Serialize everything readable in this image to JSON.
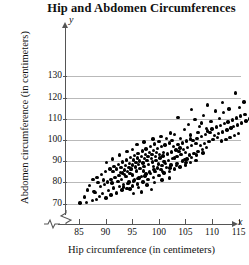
{
  "chart_data": {
    "type": "scatter",
    "title": "Hip and Abdomen Circumferences",
    "xlabel": "Hip circumference (in centimeters)",
    "ylabel": "Abdomen circumference (in centimeters)",
    "x_axis_symbol": "x",
    "y_axis_symbol": "y",
    "xlim": [
      82,
      118
    ],
    "ylim": [
      66,
      134
    ],
    "xticks": [
      85,
      90,
      95,
      100,
      105,
      110,
      115
    ],
    "yticks": [
      70,
      80,
      90,
      100,
      110,
      120,
      130
    ],
    "grid": "horizontal",
    "axis_break_x": true,
    "axis_break_y": true,
    "legend": "none",
    "marker_color": "#000000",
    "gridline_color": "#b9b9b9",
    "axis_color": "#555555",
    "points": [
      [
        85.2,
        70.2
      ],
      [
        86.4,
        70.4
      ],
      [
        87.5,
        71.3
      ],
      [
        88.3,
        72.0
      ],
      [
        86.0,
        73.1
      ],
      [
        88.9,
        73.4
      ],
      [
        90.1,
        72.6
      ],
      [
        89.4,
        74.8
      ],
      [
        87.8,
        75.6
      ],
      [
        91.0,
        74.1
      ],
      [
        90.6,
        76.2
      ],
      [
        92.0,
        75.0
      ],
      [
        91.5,
        77.3
      ],
      [
        89.0,
        77.9
      ],
      [
        93.1,
        76.4
      ],
      [
        92.6,
        78.1
      ],
      [
        94.0,
        77.2
      ],
      [
        93.4,
        79.0
      ],
      [
        91.2,
        79.6
      ],
      [
        95.0,
        78.3
      ],
      [
        94.4,
        80.1
      ],
      [
        96.0,
        79.2
      ],
      [
        95.4,
        81.0
      ],
      [
        93.0,
        81.4
      ],
      [
        97.0,
        80.2
      ],
      [
        96.3,
        82.1
      ],
      [
        98.0,
        81.3
      ],
      [
        97.4,
        83.0
      ],
      [
        95.1,
        83.5
      ],
      [
        99.0,
        82.2
      ],
      [
        98.4,
        84.1
      ],
      [
        100.0,
        83.2
      ],
      [
        99.3,
        85.0
      ],
      [
        97.1,
        85.4
      ],
      [
        101.0,
        84.3
      ],
      [
        100.4,
        86.1
      ],
      [
        102.0,
        85.2
      ],
      [
        101.4,
        87.0
      ],
      [
        99.0,
        87.4
      ],
      [
        103.0,
        86.3
      ],
      [
        102.3,
        88.1
      ],
      [
        104.0,
        87.2
      ],
      [
        103.4,
        89.0
      ],
      [
        101.1,
        89.5
      ],
      [
        105.0,
        88.2
      ],
      [
        104.4,
        90.1
      ],
      [
        106.0,
        89.3
      ],
      [
        105.3,
        91.0
      ],
      [
        103.0,
        91.5
      ],
      [
        107.0,
        90.2
      ],
      [
        92.3,
        80.5
      ],
      [
        93.8,
        82.6
      ],
      [
        94.6,
        84.2
      ],
      [
        95.8,
        85.3
      ],
      [
        96.5,
        86.4
      ],
      [
        97.2,
        87.6
      ],
      [
        98.1,
        88.4
      ],
      [
        98.8,
        89.5
      ],
      [
        99.5,
        90.3
      ],
      [
        100.2,
        91.4
      ],
      [
        94.2,
        79.4
      ],
      [
        95.2,
        80.6
      ],
      [
        96.1,
        81.7
      ],
      [
        96.8,
        82.8
      ],
      [
        97.6,
        83.9
      ],
      [
        98.3,
        84.8
      ],
      [
        99.1,
        85.9
      ],
      [
        99.8,
        86.8
      ],
      [
        100.6,
        87.9
      ],
      [
        101.3,
        88.8
      ],
      [
        93.5,
        83.8
      ],
      [
        94.8,
        86.0
      ],
      [
        95.6,
        87.2
      ],
      [
        96.2,
        88.3
      ],
      [
        97.0,
        89.1
      ],
      [
        97.8,
        90.2
      ],
      [
        98.6,
        91.1
      ],
      [
        99.4,
        92.2
      ],
      [
        100.1,
        93.1
      ],
      [
        100.9,
        94.0
      ],
      [
        92.8,
        84.6
      ],
      [
        93.6,
        85.8
      ],
      [
        94.4,
        87.0
      ],
      [
        95.0,
        88.1
      ],
      [
        95.7,
        89.2
      ],
      [
        96.4,
        90.0
      ],
      [
        97.3,
        91.2
      ],
      [
        98.0,
        92.1
      ],
      [
        98.7,
        93.0
      ],
      [
        99.6,
        94.2
      ],
      [
        91.8,
        82.4
      ],
      [
        92.5,
        83.2
      ],
      [
        93.2,
        84.4
      ],
      [
        94.1,
        85.2
      ],
      [
        94.9,
        86.6
      ],
      [
        91.4,
        85.0
      ],
      [
        92.1,
        86.2
      ],
      [
        92.9,
        87.1
      ],
      [
        93.7,
        88.0
      ],
      [
        94.5,
        88.9
      ],
      [
        95.3,
        90.5
      ],
      [
        96.0,
        91.4
      ],
      [
        96.7,
        92.3
      ],
      [
        97.5,
        93.2
      ],
      [
        98.2,
        94.1
      ],
      [
        99.0,
        95.0
      ],
      [
        99.7,
        95.9
      ],
      [
        100.5,
        96.8
      ],
      [
        101.2,
        97.6
      ],
      [
        102.0,
        98.5
      ],
      [
        100.8,
        92.5
      ],
      [
        101.6,
        93.4
      ],
      [
        102.4,
        94.3
      ],
      [
        103.2,
        95.2
      ],
      [
        104.0,
        96.1
      ],
      [
        101.8,
        90.4
      ],
      [
        102.6,
        91.3
      ],
      [
        103.4,
        92.2
      ],
      [
        104.2,
        93.1
      ],
      [
        105.0,
        94.0
      ],
      [
        102.8,
        96.8
      ],
      [
        103.6,
        97.7
      ],
      [
        104.4,
        98.6
      ],
      [
        105.2,
        99.5
      ],
      [
        106.0,
        100.4
      ],
      [
        103.8,
        94.6
      ],
      [
        104.6,
        95.5
      ],
      [
        105.4,
        96.4
      ],
      [
        106.2,
        97.3
      ],
      [
        107.0,
        98.2
      ],
      [
        105.8,
        92.8
      ],
      [
        106.6,
        93.7
      ],
      [
        107.4,
        94.6
      ],
      [
        108.2,
        95.5
      ],
      [
        109.0,
        96.4
      ],
      [
        106.4,
        99.8
      ],
      [
        107.2,
        100.7
      ],
      [
        108.0,
        101.6
      ],
      [
        108.8,
        102.5
      ],
      [
        109.6,
        103.4
      ],
      [
        107.8,
        97.5
      ],
      [
        108.6,
        98.4
      ],
      [
        109.4,
        99.3
      ],
      [
        110.2,
        100.2
      ],
      [
        111.0,
        101.1
      ],
      [
        109.2,
        104.2
      ],
      [
        110.0,
        105.1
      ],
      [
        110.8,
        106.0
      ],
      [
        111.6,
        106.9
      ],
      [
        112.4,
        107.8
      ],
      [
        110.5,
        102.0
      ],
      [
        111.2,
        102.9
      ],
      [
        112.0,
        103.8
      ],
      [
        112.8,
        104.7
      ],
      [
        113.6,
        105.6
      ],
      [
        111.8,
        99.4
      ],
      [
        112.6,
        100.3
      ],
      [
        113.4,
        101.2
      ],
      [
        114.2,
        102.1
      ],
      [
        115.0,
        103.0
      ],
      [
        113.0,
        108.5
      ],
      [
        113.8,
        109.4
      ],
      [
        114.6,
        110.3
      ],
      [
        115.4,
        111.2
      ],
      [
        116.2,
        112.1
      ],
      [
        114.0,
        106.2
      ],
      [
        114.8,
        107.1
      ],
      [
        115.6,
        108.0
      ],
      [
        116.4,
        108.9
      ],
      [
        117.0,
        109.8
      ],
      [
        112.2,
        112.8
      ],
      [
        110.6,
        113.6
      ],
      [
        108.4,
        111.4
      ],
      [
        106.8,
        109.6
      ],
      [
        105.6,
        107.2
      ],
      [
        109.8,
        108.8
      ],
      [
        107.6,
        106.4
      ],
      [
        104.8,
        104.8
      ],
      [
        103.0,
        102.6
      ],
      [
        101.5,
        100.8
      ],
      [
        114.4,
        122.2
      ],
      [
        112.0,
        117.6
      ],
      [
        109.2,
        116.4
      ],
      [
        106.2,
        114.2
      ],
      [
        103.6,
        110.5
      ],
      [
        116.0,
        117.8
      ],
      [
        115.2,
        115.4
      ],
      [
        113.2,
        114.6
      ],
      [
        111.4,
        110.2
      ],
      [
        108.0,
        108.0
      ],
      [
        100.0,
        99.2
      ],
      [
        99.2,
        98.0
      ],
      [
        98.4,
        97.0
      ],
      [
        97.6,
        95.8
      ],
      [
        96.9,
        94.8
      ],
      [
        96.1,
        93.6
      ],
      [
        95.4,
        92.6
      ],
      [
        94.7,
        91.6
      ],
      [
        93.9,
        90.6
      ],
      [
        93.2,
        89.6
      ],
      [
        92.4,
        88.4
      ],
      [
        91.6,
        87.4
      ],
      [
        90.8,
        86.2
      ],
      [
        90.0,
        85.0
      ],
      [
        89.2,
        83.8
      ],
      [
        88.4,
        82.4
      ],
      [
        87.6,
        81.2
      ],
      [
        90.4,
        80.2
      ],
      [
        91.0,
        81.4
      ],
      [
        89.8,
        79.0
      ],
      [
        95.9,
        97.8
      ],
      [
        97.2,
        99.0
      ],
      [
        98.9,
        100.4
      ],
      [
        100.4,
        101.6
      ],
      [
        102.2,
        103.2
      ],
      [
        94.0,
        94.4
      ],
      [
        95.0,
        95.6
      ],
      [
        92.6,
        92.8
      ],
      [
        91.3,
        91.0
      ],
      [
        90.2,
        89.4
      ],
      [
        99.9,
        88.6
      ],
      [
        101.0,
        89.8
      ],
      [
        102.1,
        86.8
      ],
      [
        103.3,
        87.8
      ],
      [
        100.7,
        85.2
      ],
      [
        104.9,
        90.8
      ],
      [
        106.1,
        91.8
      ],
      [
        107.1,
        92.8
      ],
      [
        105.1,
        89.4
      ],
      [
        108.3,
        93.8
      ],
      [
        93.4,
        77.8
      ],
      [
        94.6,
        76.8
      ],
      [
        96.2,
        77.6
      ],
      [
        97.8,
        78.8
      ],
      [
        99.2,
        79.8
      ],
      [
        100.6,
        81.0
      ],
      [
        102.0,
        82.0
      ],
      [
        98.6,
        76.6
      ],
      [
        96.8,
        75.4
      ],
      [
        95.2,
        74.6
      ],
      [
        87.0,
        78.6
      ],
      [
        88.6,
        79.8
      ],
      [
        89.6,
        81.0
      ],
      [
        86.6,
        76.4
      ],
      [
        88.0,
        75.2
      ],
      [
        102.5,
        99.6
      ],
      [
        104.1,
        100.8
      ],
      [
        105.9,
        102.4
      ],
      [
        107.4,
        103.6
      ],
      [
        109.0,
        105.4
      ]
    ]
  }
}
